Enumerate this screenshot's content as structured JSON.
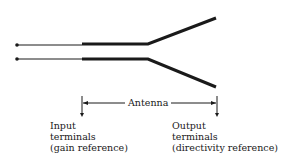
{
  "diagram": {
    "span_label": "Antenna",
    "input_label": [
      "Input",
      "terminals",
      "(gain reference)"
    ],
    "output_label": [
      "Output",
      "terminals",
      "(directivity reference)"
    ],
    "colors": {
      "line": "#1a1a1a",
      "background": "#ffffff"
    }
  }
}
